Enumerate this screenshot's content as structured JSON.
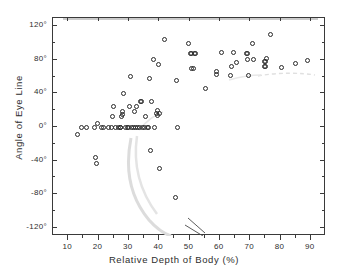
{
  "chart_data": {
    "type": "scatter",
    "title": "",
    "xlabel": "Relative Depth of Body (%)",
    "ylabel": "Angle of Eye Line",
    "xlim": [
      5,
      95
    ],
    "ylim": [
      -130,
      130
    ],
    "xticks": [
      10,
      20,
      30,
      40,
      50,
      60,
      70,
      80,
      90
    ],
    "xtick_labels": [
      "10",
      "20",
      "30",
      "40",
      "50",
      "60",
      "70",
      "80",
      "90"
    ],
    "yticks": [
      -120,
      -80,
      -40,
      0,
      40,
      80,
      120
    ],
    "ytick_labels": [
      "-120°",
      "-80°",
      "-40°",
      "0°",
      "40°",
      "80°",
      "120°"
    ],
    "grid": false,
    "legend": null,
    "marker": "open-circle",
    "marker_color": "#2a2a2a",
    "points": [
      [
        13.2,
        -9
      ],
      [
        14.4,
        0
      ],
      [
        16.0,
        0
      ],
      [
        18.6,
        0
      ],
      [
        19.0,
        -36
      ],
      [
        19.4,
        -43
      ],
      [
        19.8,
        4
      ],
      [
        21.0,
        0
      ],
      [
        21.8,
        0
      ],
      [
        23.2,
        0
      ],
      [
        24.4,
        0
      ],
      [
        24.6,
        12
      ],
      [
        24.8,
        24
      ],
      [
        25.6,
        0
      ],
      [
        26.6,
        0
      ],
      [
        27.2,
        0
      ],
      [
        27.4,
        0
      ],
      [
        27.6,
        13
      ],
      [
        27.8,
        15
      ],
      [
        28.0,
        18
      ],
      [
        28.2,
        40
      ],
      [
        29.0,
        0
      ],
      [
        29.6,
        0
      ],
      [
        30.0,
        0
      ],
      [
        30.2,
        24
      ],
      [
        30.4,
        60
      ],
      [
        30.8,
        0
      ],
      [
        31.4,
        0
      ],
      [
        31.8,
        19
      ],
      [
        32.2,
        0
      ],
      [
        32.6,
        24
      ],
      [
        33.0,
        0
      ],
      [
        33.4,
        0
      ],
      [
        33.8,
        30
      ],
      [
        34.2,
        30
      ],
      [
        34.6,
        0
      ],
      [
        35.0,
        0
      ],
      [
        35.6,
        12
      ],
      [
        36.0,
        0
      ],
      [
        36.4,
        0
      ],
      [
        36.8,
        58
      ],
      [
        37.2,
        -28
      ],
      [
        37.6,
        30
      ],
      [
        38.0,
        81
      ],
      [
        38.6,
        0
      ],
      [
        39.0,
        16
      ],
      [
        39.4,
        20
      ],
      [
        39.6,
        14
      ],
      [
        39.8,
        74
      ],
      [
        40.0,
        16
      ],
      [
        40.2,
        -50
      ],
      [
        41.8,
        104
      ],
      [
        45.4,
        -84
      ],
      [
        45.6,
        55
      ],
      [
        46.2,
        0
      ],
      [
        49.8,
        100
      ],
      [
        50.4,
        88
      ],
      [
        50.6,
        88
      ],
      [
        50.8,
        70
      ],
      [
        51.2,
        70
      ],
      [
        51.6,
        88
      ],
      [
        52.0,
        88
      ],
      [
        55.4,
        46
      ],
      [
        58.8,
        66
      ],
      [
        59.0,
        63
      ],
      [
        60.4,
        89
      ],
      [
        63.6,
        62
      ],
      [
        64.0,
        72
      ],
      [
        64.4,
        89
      ],
      [
        65.6,
        77
      ],
      [
        68.8,
        88
      ],
      [
        69.0,
        88
      ],
      [
        69.2,
        80
      ],
      [
        69.4,
        62
      ],
      [
        70.8,
        100
      ],
      [
        71.2,
        80
      ],
      [
        74.6,
        72
      ],
      [
        74.8,
        78
      ],
      [
        75.0,
        78
      ],
      [
        75.2,
        72
      ],
      [
        75.4,
        82
      ],
      [
        76.8,
        110
      ],
      [
        80.2,
        71
      ],
      [
        85.0,
        76
      ],
      [
        88.8,
        79
      ]
    ]
  }
}
